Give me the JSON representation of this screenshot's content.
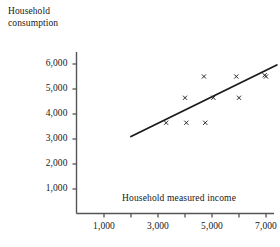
{
  "chart_data": {
    "type": "scatter",
    "title": "",
    "xlabel": "Household measured income",
    "ylabel": "Household consumption",
    "ylabel_lines": [
      "Household",
      "consumption"
    ],
    "xlim": [
      0,
      7800
    ],
    "ylim": [
      0,
      6400
    ],
    "grid": false,
    "legend": null,
    "axis": {
      "x_ticks": [
        1000,
        2000,
        3000,
        4000,
        5000,
        6000,
        7000
      ],
      "x_tick_labels": [
        "1,000",
        "",
        "3,000",
        "",
        "5,000",
        "",
        "7,000"
      ],
      "x_labeled_ticks": [
        {
          "value": 1000,
          "label": "1,000"
        },
        {
          "value": 3000,
          "label": "3,000"
        },
        {
          "value": 5000,
          "label": "5,000"
        },
        {
          "value": 7000,
          "label": "7,000"
        }
      ],
      "y_ticks": [
        1000,
        2000,
        3000,
        4000,
        5000,
        6000
      ],
      "y_tick_labels": [
        "1,000",
        "2,000",
        "3,000",
        "4,000",
        "5,000",
        "6,000"
      ]
    },
    "points": [
      {
        "x": 3300,
        "y": 3650
      },
      {
        "x": 4000,
        "y": 4650
      },
      {
        "x": 4050,
        "y": 3650
      },
      {
        "x": 4700,
        "y": 5500
      },
      {
        "x": 4750,
        "y": 3650
      },
      {
        "x": 5050,
        "y": 4650
      },
      {
        "x": 5900,
        "y": 5500
      },
      {
        "x": 6000,
        "y": 4650
      },
      {
        "x": 7000,
        "y": 5500
      },
      {
        "x": 6950,
        "y": 5550
      }
    ],
    "fit_line": {
      "label": "regression line",
      "x0": 2000,
      "y0": 3100,
      "x1": 7400,
      "y1": 5960
    },
    "colors": {
      "axis": "#555555",
      "marker": "#2b2b2b",
      "line": "#1c1c1c",
      "text": "#171717",
      "background": "#ffffff"
    }
  }
}
